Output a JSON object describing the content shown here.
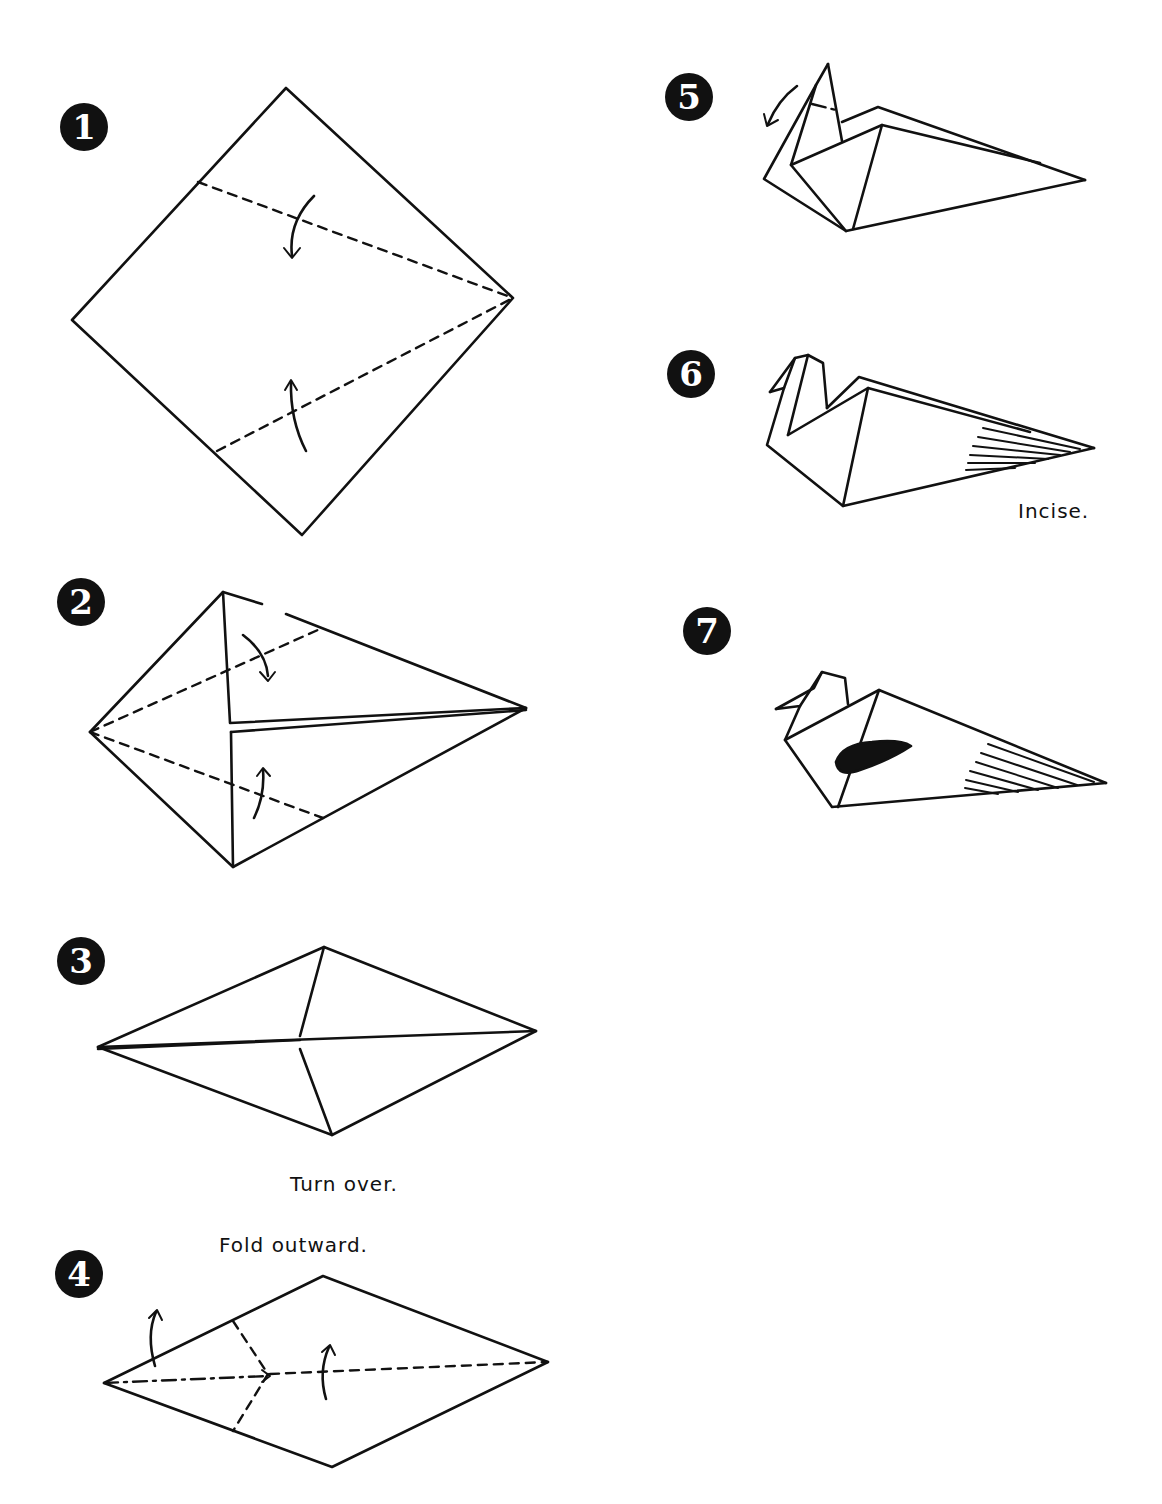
{
  "page": {
    "title_clipped": "",
    "background": "#ffffff",
    "ink": "#111111"
  },
  "steps": [
    {
      "number": "1",
      "caption": ""
    },
    {
      "number": "2",
      "caption": ""
    },
    {
      "number": "3",
      "caption": "Turn over."
    },
    {
      "number": "4",
      "caption": "Fold outward."
    },
    {
      "number": "5",
      "caption": ""
    },
    {
      "number": "6",
      "caption": "Incise."
    },
    {
      "number": "7",
      "caption": ""
    }
  ],
  "icons": {
    "fold_arrow": "curved-arrow",
    "valley_fold": "dashed-line",
    "mountain_fold": "dash-dot-line"
  }
}
